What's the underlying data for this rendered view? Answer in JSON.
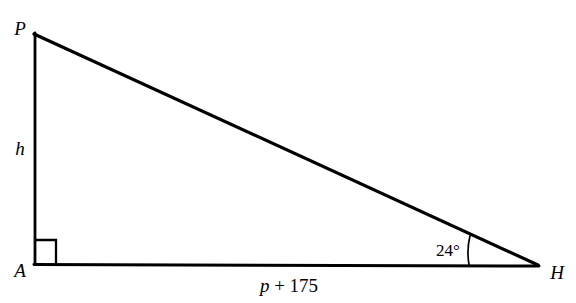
{
  "figure": {
    "type": "right-triangle-diagram",
    "background_color": "#ffffff",
    "stroke_color": "#000000",
    "vertices": [
      {
        "name": "P",
        "label": "P",
        "x": 33,
        "y": 33
      },
      {
        "name": "A",
        "label": "A",
        "x": 35,
        "y": 264
      },
      {
        "name": "H",
        "label": "H",
        "x": 538,
        "y": 266
      }
    ],
    "sides": [
      {
        "name": "PA",
        "label": "h",
        "role": "opposite-leg-vertical"
      },
      {
        "name": "AH",
        "label": "p + 175",
        "role": "adjacent-leg-horizontal"
      },
      {
        "name": "PH",
        "label": "",
        "role": "hypotenuse"
      }
    ],
    "labels": {
      "vertex_p": "P",
      "vertex_a": "A",
      "vertex_h": "H",
      "height_side": "h",
      "base_expression_variable": "p",
      "base_expression_operator": "+",
      "base_expression_number": "175",
      "base_expression_full": "p + 175",
      "angle_at_h": "24°",
      "angle_at_h_value": 24,
      "angle_at_h_unit": "degrees"
    },
    "markers": {
      "right_angle": {
        "at_vertex": "A",
        "label": "right-angle-marker",
        "size_px": 22
      },
      "angle_arc": {
        "at_vertex": "H",
        "label": "angle-arc-24",
        "radius_px": 70
      }
    }
  }
}
